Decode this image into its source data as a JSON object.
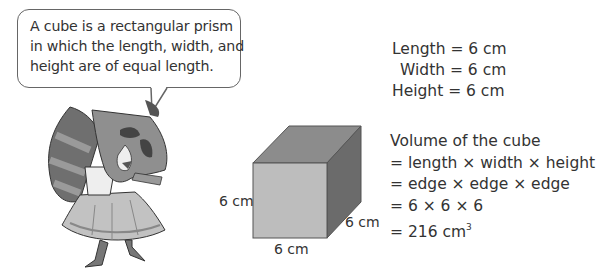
{
  "speech_bubble": {
    "lines": [
      "A cube is a rectangular prism",
      "in which the length, width, and",
      "height are of equal length."
    ]
  },
  "character": {
    "icon": "raccoon-mascot-icon"
  },
  "cube": {
    "colors": {
      "front": "#bdbdbd",
      "top": "#8c8c8c",
      "side": "#6b6b6b",
      "edge": "#555555"
    },
    "labels": {
      "height": "6 cm",
      "length": "6 cm",
      "depth": "6 cm"
    }
  },
  "dimensions": {
    "length": "Length = 6 cm",
    "width": "Width = 6 cm",
    "height": "Height = 6 cm"
  },
  "volume": {
    "title": "Volume of the cube",
    "steps": [
      "= length × width × height",
      "= edge × edge × edge",
      "= 6 × 6 × 6"
    ],
    "result_prefix": "= 216 cm",
    "result_exponent": "3"
  }
}
